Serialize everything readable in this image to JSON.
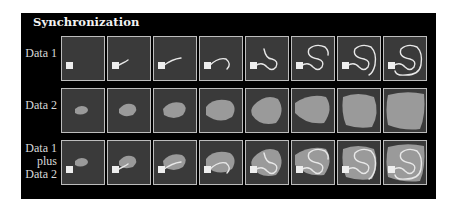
{
  "figure": {
    "title": "Synchronization",
    "background": "#000000",
    "panel_background": "#3a3a3a",
    "panel_border": "#bdbdbd",
    "blob_color": "#9a9a9a",
    "trace_color": "#e8e8e8",
    "marker_color": "#eeeeee",
    "frames_per_row": 8,
    "rows": [
      {
        "id": "data1",
        "label_lines": [
          "Data 1"
        ],
        "content": "trajectory trace growing from square marker"
      },
      {
        "id": "data2",
        "label_lines": [
          "Data 2"
        ],
        "content": "gray blob region expanding"
      },
      {
        "id": "combined",
        "label_lines": [
          "Data 1",
          "plus",
          "Data 2"
        ],
        "content": "trace overlaid on blob"
      }
    ]
  }
}
